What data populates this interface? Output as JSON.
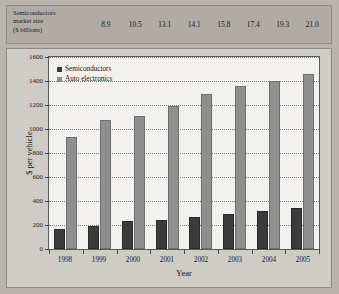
{
  "strip": {
    "label": "Semiconductors market size ($ billions)",
    "label_line1": "Semiconductors",
    "label_line2": "market size",
    "label_line3": "($ billions)",
    "values": [
      "8.9",
      "10.5",
      "13.1",
      "14.1",
      "15.8",
      "17.4",
      "19.3",
      "21.0"
    ]
  },
  "chart_data": {
    "type": "bar",
    "title": "",
    "xlabel": "Year",
    "ylabel": "$ per vehicle",
    "categories": [
      "1998",
      "1999",
      "2000",
      "2001",
      "2002",
      "2003",
      "2004",
      "2005"
    ],
    "series": [
      {
        "name": "Semiconductors",
        "color": "#3b3b3b",
        "values": [
          170,
          195,
          230,
          240,
          265,
          290,
          315,
          340
        ]
      },
      {
        "name": "Auto electronics",
        "color": "#8f8f8f",
        "values": [
          935,
          1075,
          1105,
          1190,
          1290,
          1355,
          1400,
          1460
        ]
      }
    ],
    "ylim": [
      0,
      1600
    ],
    "yticks": [
      0,
      200,
      400,
      600,
      800,
      1000,
      1200,
      1400,
      1600
    ],
    "ytick_labels": [
      "0",
      "200",
      "400",
      "600",
      "800",
      "1000",
      "1200",
      "1400",
      "1600"
    ],
    "grid": true,
    "legend_position": "top-left",
    "legend": [
      "Semiconductors",
      "Auto electronics"
    ]
  }
}
